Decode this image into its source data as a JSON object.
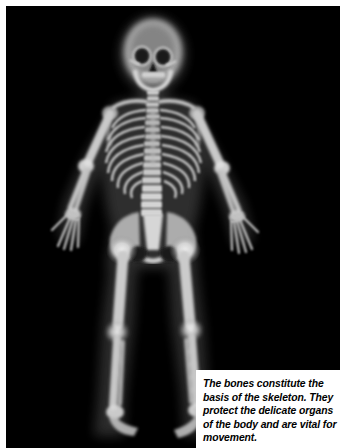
{
  "page": {
    "background_color": "#ffffff",
    "margin_color": "#ffffff"
  },
  "radiograph": {
    "name": "full-body-skeleton-xray",
    "modality": "x-ray",
    "background_color": "#000000",
    "bone_color": "#e8e8e8",
    "soft_tissue_color": "#3a3a3a",
    "subject": "human skeleton, full body, anterior view",
    "regions": [
      "skull",
      "mandible",
      "cervical-spine",
      "clavicles",
      "ribcage",
      "thoracic-spine",
      "lumbar-spine",
      "pelvis",
      "left-arm",
      "right-arm",
      "left-hand",
      "right-hand",
      "femurs",
      "knees",
      "tibias",
      "fibulas",
      "ankles",
      "feet"
    ]
  },
  "caption": {
    "text": "The bones constitute the basis of the skeleton. They protect the delicate organs of the body and are vital for movement.",
    "background_color": "#ffffff",
    "text_color": "#000000"
  }
}
